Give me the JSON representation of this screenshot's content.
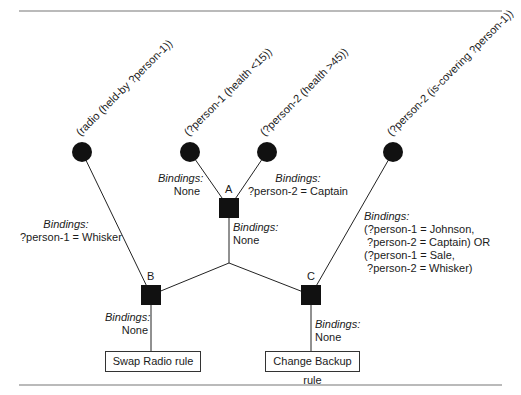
{
  "diagram": {
    "type": "rete-network",
    "conditions": [
      {
        "id": "c1",
        "text": "(radio (held-by ?person-1))"
      },
      {
        "id": "c2",
        "text": "(?person-1 (health <15))"
      },
      {
        "id": "c3",
        "text": "(?person-2 (health >45))"
      },
      {
        "id": "c4",
        "text": "(?person-2 (is-covering ?person-1))"
      }
    ],
    "join_nodes": [
      {
        "id": "A",
        "label": "A"
      },
      {
        "id": "B",
        "label": "B"
      },
      {
        "id": "C",
        "label": "C"
      }
    ],
    "bindings": {
      "heading": "Bindings",
      "c2_to_A": [
        "None"
      ],
      "c3_to_A": [
        "?person-2 = Captain"
      ],
      "c1_to_B": [
        "?person-1 = Whisker"
      ],
      "A_to_junction": [
        "None"
      ],
      "c4_to_C": [
        "(?person-1 = Johnson,",
        " ?person-2 = Captain) OR",
        "(?person-1 = Sale,",
        " ?person-2 = Whisker)"
      ],
      "B_to_rule": [
        "None"
      ],
      "C_to_rule": [
        "None"
      ]
    },
    "rules": [
      {
        "id": "swap-radio",
        "label": "Swap Radio rule"
      },
      {
        "id": "change-backup",
        "label": "Change Backup rule"
      }
    ]
  }
}
